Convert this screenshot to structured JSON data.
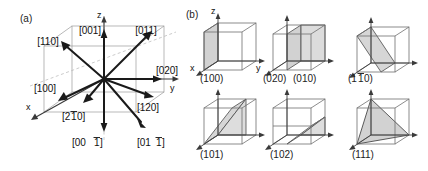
{
  "figure": {
    "type": "crystallographic-direction-and-plane-diagram",
    "panels": [
      {
        "id": "a",
        "label": "(a)",
        "caption": "Crystallographic directions in a cubic unit cell",
        "axes": [
          {
            "name": "x-axis-label",
            "text": "x"
          },
          {
            "name": "y-axis-label",
            "text": "y"
          },
          {
            "name": "z-axis-label",
            "text": "z"
          }
        ],
        "directions": [
          {
            "label": "[001]",
            "overbar": "",
            "name": "direction-001"
          },
          {
            "label": "[011]",
            "overbar": "",
            "name": "direction-011"
          },
          {
            "label": "[110]",
            "overbar": "",
            "name": "direction-110"
          },
          {
            "label": "[100]",
            "overbar": "",
            "name": "direction-100"
          },
          {
            "label": "[020]",
            "overbar": "",
            "name": "direction-020"
          },
          {
            "label": "[120]",
            "overbar": "",
            "name": "direction-120"
          },
          {
            "label": "[210]",
            "overbar": "1",
            "name": "direction-2bar10"
          },
          {
            "label": "[001]",
            "overbar": "1",
            "name": "direction-00bar1"
          },
          {
            "label": "[011]",
            "overbar": "1",
            "name": "direction-01bar1"
          }
        ]
      },
      {
        "id": "b",
        "label": "(b)",
        "caption": "Crystallographic planes shaded in cubic unit cells",
        "axes": [
          {
            "name": "x-axis-label",
            "text": "x"
          },
          {
            "name": "y-axis-label",
            "text": "y"
          },
          {
            "name": "z-axis-label",
            "text": "z"
          }
        ],
        "cells": [
          {
            "name": "plane-cell-100",
            "label": "(100)",
            "overbar": "",
            "row": 1,
            "col": 1
          },
          {
            "name": "plane-cell-020",
            "label": "(020)",
            "overbar": "",
            "row": 1,
            "col": 2
          },
          {
            "name": "plane-cell-010",
            "label": "(010)",
            "overbar": "",
            "row": 1,
            "col": 2
          },
          {
            "name": "plane-cell-1bar10",
            "label": "(110)",
            "overbar": "1",
            "row": 1,
            "col": 3
          },
          {
            "name": "plane-cell-101",
            "label": "(101)",
            "overbar": "",
            "row": 2,
            "col": 1
          },
          {
            "name": "plane-cell-102",
            "label": "(102)",
            "overbar": "",
            "row": 2,
            "col": 2
          },
          {
            "name": "plane-cell-111",
            "label": "(111)",
            "overbar": "",
            "row": 2,
            "col": 3
          }
        ]
      }
    ],
    "colors": {
      "arrow": "#1a1a1a",
      "cell_edge": "#8a8a8a",
      "cell_edge_dark": "#555555",
      "plane_fill": "#d0d0d0",
      "plane_edge": "#4a4a4a",
      "text": "#111111",
      "background": "#ffffff"
    }
  },
  "labels": {
    "panel_a": "(a)",
    "panel_b": "(b)",
    "x": "x",
    "y": "y",
    "z": "z",
    "d001": "[001]",
    "d011": "[011]",
    "d110": "[110]",
    "d100": "[100]",
    "d020": "[020]",
    "d120": "[120]",
    "d2bar10_a": "[2",
    "d2bar10_b": "1",
    "d2bar10_c": "0]",
    "d00bar1_a": "[00",
    "d00bar1_b": "1",
    "d00bar1_c": "]",
    "d01bar1_a": "[01",
    "d01bar1_b": "1",
    "d01bar1_c": "]",
    "p100": "(100)",
    "p020": "(020)",
    "p010": "(010)",
    "p1bar10_a": "(1",
    "p1bar10_b": "1",
    "p1bar10_c": "0)",
    "p101": "(101)",
    "p102": "(102)",
    "p111": "(111)"
  }
}
